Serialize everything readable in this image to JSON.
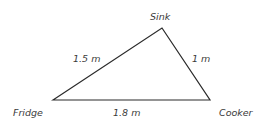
{
  "diagram": {
    "type": "triangle",
    "vertices": [
      {
        "id": "fridge",
        "label": "Fridge",
        "x": 53,
        "y": 100
      },
      {
        "id": "sink",
        "label": "Sink",
        "x": 162,
        "y": 28
      },
      {
        "id": "cooker",
        "label": "Cooker",
        "x": 210,
        "y": 100
      }
    ],
    "edges": [
      {
        "from": "fridge",
        "to": "sink",
        "label": "1.5 m"
      },
      {
        "from": "sink",
        "to": "cooker",
        "label": "1 m"
      },
      {
        "from": "fridge",
        "to": "cooker",
        "label": "1.8 m"
      }
    ],
    "line_color": "#2a2a2a"
  }
}
